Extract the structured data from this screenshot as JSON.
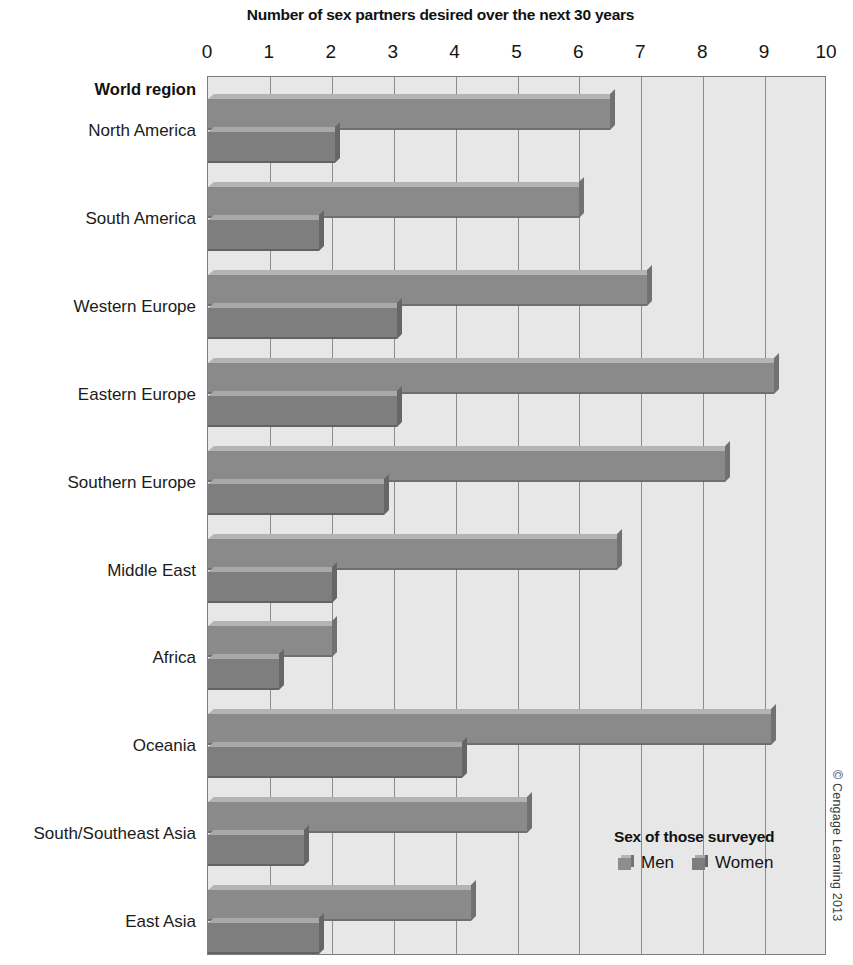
{
  "chart_data": {
    "type": "bar",
    "orientation": "horizontal",
    "title": "Number of sex partners desired over the next 30 years",
    "xlabel": "Number of sex partners desired over the next 30 years",
    "ylabel": "World region",
    "xlim": [
      0,
      10
    ],
    "xticks": [
      "0",
      "1",
      "2",
      "3",
      "4",
      "5",
      "6",
      "7",
      "8",
      "9",
      "10"
    ],
    "grid": true,
    "legend_position": "inside-bottom-right",
    "legend_title": "Sex of those surveyed",
    "categories": [
      "North America",
      "South America",
      "Western Europe",
      "Eastern Europe",
      "Southern Europe",
      "Middle East",
      "Africa",
      "Oceania",
      "South/Southeast Asia",
      "East Asia"
    ],
    "series": [
      {
        "name": "Men",
        "color": "#8a8a8a",
        "values": [
          6.5,
          6.0,
          7.1,
          9.15,
          8.35,
          6.6,
          2.0,
          9.1,
          5.15,
          4.25
        ]
      },
      {
        "name": "Women",
        "color": "#7e7e7e",
        "values": [
          2.05,
          1.8,
          3.05,
          3.05,
          2.85,
          2.0,
          1.15,
          4.1,
          1.55,
          1.8
        ]
      }
    ],
    "credit": "© Cengage Learning 2013"
  },
  "colors": {
    "plot_background": "#e7e7e7",
    "plot_border": "#7c7c7c",
    "gridline": "#8d8d8d",
    "men_bar": "#8a8a8a",
    "women_bar": "#7e7e7e",
    "text": "#1a1a1a"
  }
}
